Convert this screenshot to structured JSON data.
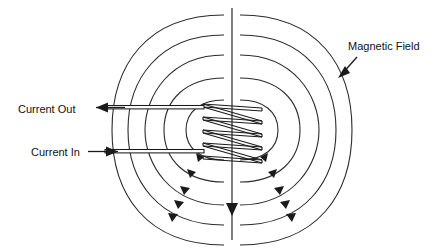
{
  "figure": {
    "title": "Magnetic field of a current-carrying coil (electromagnet)",
    "background_color": "#ffffff",
    "line_color": "#2b2b2b",
    "text_color": "#111111",
    "width": 444,
    "height": 248
  },
  "labels": {
    "current_out": "Current Out",
    "current_in": "Current In",
    "magnetic_field": "Magnetic Field"
  },
  "diagram_data": {
    "type": "schematic",
    "subject": "solenoid electromagnet with magnetic field lines",
    "center_axis": {
      "x": 232,
      "y_top": 8,
      "y_bottom": 240,
      "direction": "down",
      "arrow_y": 210
    },
    "coil": {
      "turns": 5,
      "left_x": 202,
      "right_x": 262,
      "top_y": 104,
      "bottom_y": 156,
      "winding": "helical"
    },
    "leads": [
      {
        "name": "current-out-lead",
        "y": 108,
        "x_start": 105,
        "x_end": 205,
        "arrow_direction": "left"
      },
      {
        "name": "current-in-lead",
        "y": 152,
        "x_start": 105,
        "x_end": 205,
        "arrow_direction": "right"
      }
    ],
    "field_loops": {
      "count_per_side": 5,
      "sides": [
        "left",
        "right"
      ],
      "center_y": 130,
      "radii_x": [
        34,
        56,
        75,
        92,
        108
      ],
      "radii_y": [
        30,
        52,
        75,
        95,
        115
      ],
      "arrowheads_per_loop": 1,
      "flow_direction": "downward through the center, outward and around"
    },
    "callout": {
      "label": "Magnetic Field",
      "text_x": 348,
      "text_y": 46,
      "arrow_from": [
        356,
        57
      ],
      "arrow_to": [
        338,
        77
      ]
    }
  }
}
